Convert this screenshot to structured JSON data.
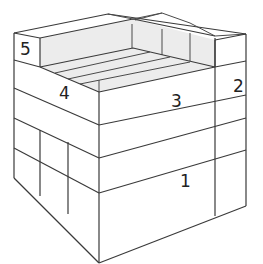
{
  "diagram": {
    "colors": {
      "background": "#ffffff",
      "line": "#3a3a3a",
      "shaded_face": "#ececec"
    },
    "labels": [
      {
        "id": "block-1",
        "text": "1"
      },
      {
        "id": "block-2",
        "text": "2"
      },
      {
        "id": "block-3",
        "text": "3"
      },
      {
        "id": "block-4",
        "text": "4"
      },
      {
        "id": "block-5",
        "text": "5"
      }
    ]
  }
}
